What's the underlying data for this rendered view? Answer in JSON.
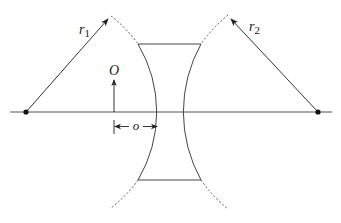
{
  "diagram": {
    "type": "thick-lens-geometry",
    "labels": {
      "r1_main": "r",
      "r1_sub": "1",
      "r2_main": "r",
      "r2_sub": "2",
      "object": "O",
      "object_distance": "o"
    },
    "colors": {
      "line": "#333333",
      "dot": "#111111",
      "background": "#ffffff"
    },
    "elements": {
      "optical_axis": {
        "x1": 10,
        "x2": 332,
        "y": 112
      },
      "left_center": {
        "x": 26,
        "y": 112
      },
      "right_center": {
        "x": 318,
        "y": 112
      },
      "lens_top_y": 44,
      "lens_bottom_y": 180,
      "object_arrow": {
        "x": 114,
        "y_base": 112,
        "y_tip": 79
      },
      "distance_marker": {
        "x_start": 114,
        "x_end": 157,
        "y": 127
      }
    }
  }
}
